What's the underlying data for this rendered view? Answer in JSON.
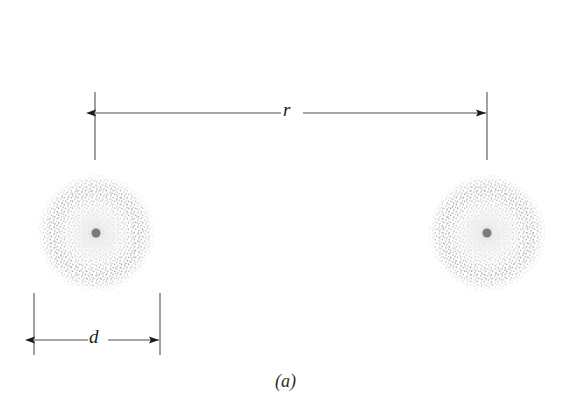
{
  "figure": {
    "caption": "(a)",
    "background_color": "#ffffff",
    "line_color": "#5a5a5a",
    "arrow_color": "#1a1a1a",
    "stipple_color": "#9a9a9a",
    "nucleus_color": "#7a7a7a",
    "width": 583,
    "height": 418
  },
  "dimensions": {
    "separation": {
      "label": "r",
      "label_x": 292,
      "arrow_y": 113,
      "left_x": 95,
      "right_x": 487,
      "extension_top": 92,
      "extension_bottom": 160
    },
    "diameter": {
      "label": "d",
      "label_x": 97,
      "arrow_y": 340,
      "left_x": 34,
      "right_x": 160,
      "extension_top": 293,
      "extension_bottom": 355
    }
  },
  "spheres": [
    {
      "name": "left-charged-sphere",
      "cx": 96,
      "cy": 233,
      "radius": 58,
      "nucleus_radius": 4.5
    },
    {
      "name": "right-charged-sphere",
      "cx": 487,
      "cy": 233,
      "radius": 58,
      "nucleus_radius": 4.5
    }
  ]
}
